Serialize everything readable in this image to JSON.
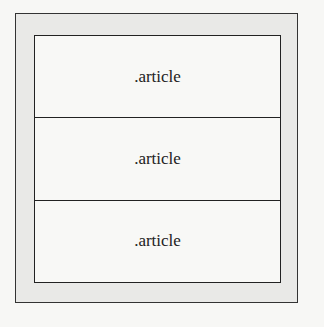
{
  "diagram": {
    "container": {
      "label": ""
    },
    "articles": [
      {
        "label": ".article"
      },
      {
        "label": ".article"
      },
      {
        "label": ".article"
      }
    ]
  }
}
